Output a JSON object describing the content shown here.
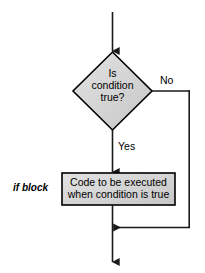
{
  "diagram": {
    "background_color": "#ffffff",
    "shape_fill_color": "#d4d4d4",
    "shape_border_color": "#000000",
    "line_color": "#1a1a1a",
    "decision": {
      "shape": "diamond",
      "line1": "Is",
      "line2": "condition",
      "line3": "true?"
    },
    "process": {
      "shape": "rectangle",
      "line1": "Code to be executed",
      "line2": "when condition is true"
    },
    "edges": {
      "yes_label": "Yes",
      "no_label": "No"
    },
    "annotation": {
      "if_block_label": "if block"
    }
  }
}
